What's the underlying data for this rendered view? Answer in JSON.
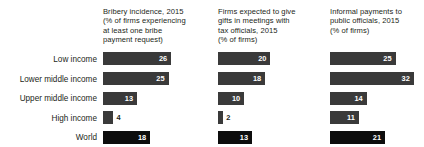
{
  "chart_data": {
    "type": "bar",
    "title": "",
    "categories": [
      "Low income",
      "Lower middle income",
      "Upper middle income",
      "High income",
      "World"
    ],
    "panels": [
      {
        "title": "Bribery incidence, 2015\n(% of firms experiencing\nat least one bribe\npayment request)",
        "values": [
          26,
          25,
          13,
          4,
          18
        ]
      },
      {
        "title": "Firms expected to give\ngifts in meetings with\ntax officials, 2015\n(% of firms)",
        "values": [
          20,
          18,
          10,
          2,
          13
        ]
      },
      {
        "title": "Informal payments to\npublic officials, 2015\n(% of firms)",
        "values": [
          25,
          32,
          14,
          11,
          21
        ]
      }
    ],
    "xlabel": "",
    "ylabel": "",
    "grid": false,
    "legend": "none",
    "colors": {
      "bar": "#3a3a3a",
      "bar_world": "#0d0d0d",
      "value_text": "#ffffff",
      "value_text_outside": "#231f20",
      "label_text": "#231f20",
      "background": "#ffffff"
    }
  }
}
